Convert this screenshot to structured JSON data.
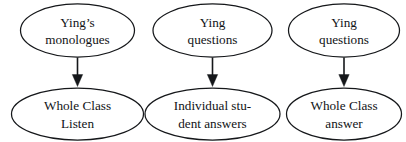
{
  "diagram": {
    "type": "flow-diagram",
    "background_color": "#ffffff",
    "stroke_color": "#15171a",
    "text_color": "#111316",
    "node_shape": "ellipse",
    "flows": [
      {
        "id": "flow-1",
        "source": {
          "id": "node-ying-monologues",
          "line1": "Ying’s",
          "line2": "monologues"
        },
        "target": {
          "id": "node-whole-class-listen",
          "line1": "Whole Class",
          "line2": "Listen"
        },
        "connector": {
          "id": "arrow-1",
          "direction": "down",
          "style": "solid-filled-arrowhead"
        }
      },
      {
        "id": "flow-2",
        "source": {
          "id": "node-ying-questions-1",
          "line1": "Ying",
          "line2": "questions"
        },
        "target": {
          "id": "node-individual-student-answers",
          "line1": "Individual stu-",
          "line2": "dent answers"
        },
        "connector": {
          "id": "arrow-2",
          "direction": "down",
          "style": "solid-filled-arrowhead"
        }
      },
      {
        "id": "flow-3",
        "source": {
          "id": "node-ying-questions-2",
          "line1": "Ying",
          "line2": "questions"
        },
        "target": {
          "id": "node-whole-class-answer",
          "line1": "Whole Class",
          "line2": "answer"
        },
        "connector": {
          "id": "arrow-3",
          "direction": "down",
          "style": "solid-filled-arrowhead"
        }
      }
    ]
  }
}
